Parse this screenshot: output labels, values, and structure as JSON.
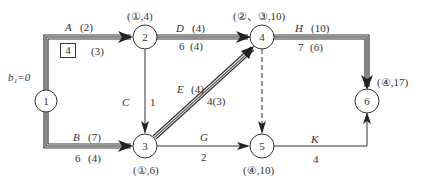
{
  "diagram": {
    "type": "activity-on-arrow network",
    "start_label": "b₁=0",
    "nodes": [
      {
        "id": "1",
        "label": "1",
        "annotation": ""
      },
      {
        "id": "2",
        "label": "2",
        "annotation": "(①,4)"
      },
      {
        "id": "3",
        "label": "3",
        "annotation": "(①,6)"
      },
      {
        "id": "4",
        "label": "4",
        "annotation": "(②、③,10)"
      },
      {
        "id": "5",
        "label": "5",
        "annotation": "(④,10)"
      },
      {
        "id": "6",
        "label": "6",
        "annotation": "(④,17)"
      }
    ],
    "edges": [
      {
        "name": "A",
        "from": "1",
        "to": "2",
        "top_value": "(2)",
        "bottom_value": "4",
        "bottom_paren": "(3)",
        "critical": true,
        "boxed": true
      },
      {
        "name": "B",
        "from": "1",
        "to": "3",
        "top_value": "(7)",
        "bottom_value": "6",
        "bottom_paren": "(4)",
        "critical": true
      },
      {
        "name": "C",
        "from": "2",
        "to": "3",
        "value": "1",
        "critical": false
      },
      {
        "name": "D",
        "from": "2",
        "to": "4",
        "top_value": "(4)",
        "bottom_value": "6",
        "bottom_paren": "(4)",
        "critical": true
      },
      {
        "name": "E",
        "from": "3",
        "to": "4",
        "top_value": "(4)",
        "bottom_value": "4(3)",
        "critical": true
      },
      {
        "name": "dummy",
        "from": "4",
        "to": "5",
        "dashed": true
      },
      {
        "name": "G",
        "from": "3",
        "to": "5",
        "value": "2",
        "critical": false
      },
      {
        "name": "H",
        "from": "4",
        "to": "6",
        "top_value": "(10)",
        "bottom_value": "7",
        "bottom_paren": "(6)",
        "critical": true
      },
      {
        "name": "K",
        "from": "5",
        "to": "6",
        "value": "4",
        "critical": false
      }
    ]
  }
}
